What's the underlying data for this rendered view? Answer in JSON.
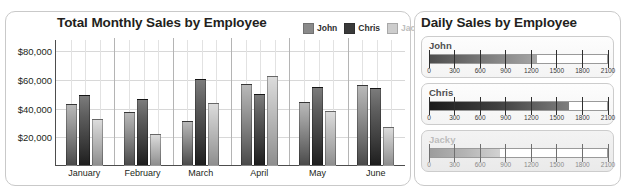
{
  "chart_panel": {
    "title": "Total Monthly Sales by Employee",
    "legend": [
      {
        "label": "John",
        "color": "#8a8a8a"
      },
      {
        "label": "Chris",
        "color": "#3a3a3a"
      },
      {
        "label": "Jacky",
        "color": "#cdcdcd"
      }
    ]
  },
  "gauge_panel": {
    "title": "Daily Sales by Employee",
    "gauges": [
      {
        "name": "John",
        "value": 1270,
        "min": 0,
        "max": 2100,
        "dim": false
      },
      {
        "name": "Chris",
        "value": 1650,
        "min": 0,
        "max": 2100,
        "dim": false
      },
      {
        "name": "Jacky",
        "value": 830,
        "min": 0,
        "max": 2100,
        "dim": true
      }
    ],
    "tick_labels": [
      "0",
      "300",
      "600",
      "900",
      "1200",
      "1500",
      "1800",
      "2100"
    ]
  },
  "chart_data": {
    "type": "bar",
    "title": "Total Monthly Sales by Employee",
    "xlabel": "",
    "ylabel": "",
    "categories": [
      "January",
      "February",
      "March",
      "April",
      "May",
      "June"
    ],
    "ytick_labels": [
      "$20,000",
      "$40,000",
      "$60,000",
      "$80,000"
    ],
    "yticks": [
      20000,
      40000,
      60000,
      80000
    ],
    "ylim": [
      0,
      88000
    ],
    "grid": true,
    "legend_position": "top-right",
    "series": [
      {
        "name": "John",
        "color": "#8a8a8a",
        "values": [
          43000,
          37500,
          31500,
          57000,
          44500,
          56500
        ]
      },
      {
        "name": "Chris",
        "color": "#3a3a3a",
        "values": [
          49500,
          46500,
          61000,
          50000,
          55500,
          54500
        ]
      },
      {
        "name": "Jacky",
        "color": "#cdcdcd",
        "values": [
          33000,
          22500,
          44000,
          63000,
          38500,
          27500
        ]
      }
    ]
  }
}
